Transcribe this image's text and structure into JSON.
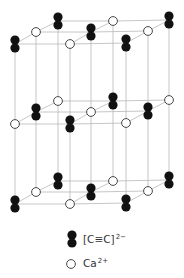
{
  "figure": {
    "legend": [
      {
        "symbol": "dumbbell-filled",
        "formula": "[C≡C]",
        "charge": "2−",
        "species": "acetylide anion"
      },
      {
        "symbol": "circle-open",
        "formula": "Ca",
        "charge": "2+",
        "species": "calcium cation"
      }
    ],
    "lattice": {
      "layers": [
        "top",
        "middle",
        "bottom"
      ],
      "grid": "3x3 per layer",
      "pattern": [
        [
          "anion",
          "cation",
          "anion",
          "cation",
          "anion",
          "cation",
          "anion",
          "cation",
          "anion"
        ],
        [
          "cation",
          "anion",
          "cation",
          "anion",
          "cation",
          "anion",
          "cation",
          "anion",
          "cation"
        ],
        [
          "anion",
          "cation",
          "anion",
          "cation",
          "anion",
          "cation",
          "anion",
          "cation",
          "anion"
        ]
      ]
    },
    "colors": {
      "anion": "#111111",
      "cation_fill": "#ffffff",
      "cation_stroke": "#333333",
      "edges": "#b8b8b8"
    }
  }
}
